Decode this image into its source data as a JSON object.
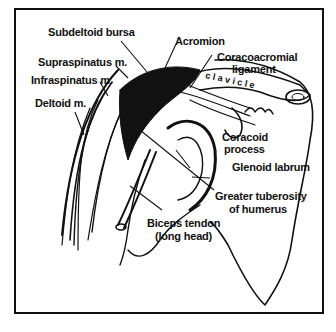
{
  "diagram": {
    "labels": [
      {
        "id": "subdeltoid_bursa",
        "text": "Subdeltoid bursa"
      },
      {
        "id": "acromion",
        "text": "Acromion"
      },
      {
        "id": "coracoacromial_ligament_1",
        "text": "Coracoacromial"
      },
      {
        "id": "coracoacromial_ligament_2",
        "text": "ligament"
      },
      {
        "id": "supraspinatus",
        "text": "Supraspinatus m."
      },
      {
        "id": "infraspinatus",
        "text": "Infraspinatus m."
      },
      {
        "id": "deltoid",
        "text": "Deltoid m."
      },
      {
        "id": "coracoid_process_1",
        "text": "Coracoid"
      },
      {
        "id": "coracoid_process_2",
        "text": "process"
      },
      {
        "id": "glenoid_labrum",
        "text": "Glenoid labrum"
      },
      {
        "id": "greater_tuberosity_1",
        "text": "Greater tuberosity"
      },
      {
        "id": "greater_tuberosity_2",
        "text": "of humerus"
      },
      {
        "id": "biceps_tendon_1",
        "text": "Biceps tendon"
      },
      {
        "id": "biceps_tendon_2",
        "text": "(long head)"
      }
    ],
    "clavicle_text": "c l a v i c l e"
  }
}
